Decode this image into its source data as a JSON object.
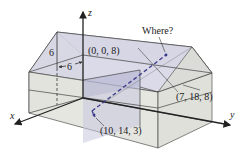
{
  "figure": {
    "type": "3d-house-coordinate-diagram",
    "axes": {
      "x": "x",
      "y": "y",
      "z": "z"
    },
    "labels": {
      "ridge_start": "(0, 0, 8)",
      "corner": "(7, 18, 8)",
      "point": "(10, 14, 3)",
      "question": "Where?",
      "dim_height": "6",
      "dim_width": "6"
    },
    "colors": {
      "wall_light": "#e4e4df",
      "wall_front": "#dcdcd6",
      "roof_blue": "#d3d3e6",
      "interior_blue": "#b9b9d6",
      "dashed_line": "#3a3a8a",
      "edge": "#333333"
    }
  }
}
